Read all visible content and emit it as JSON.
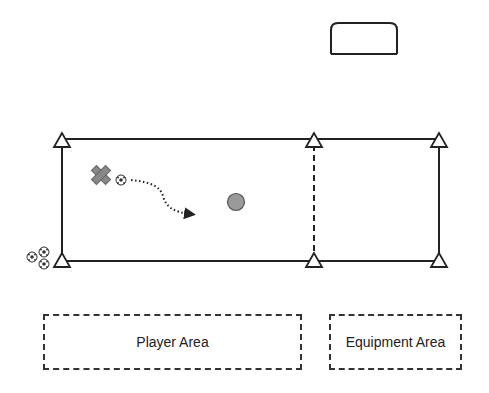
{
  "diagram": {
    "type": "soccer drill layout",
    "goal": {
      "label": "goal",
      "shape": "rounded-rectangle"
    },
    "field": {
      "main_grid": {
        "border": "solid"
      },
      "divider": {
        "style": "dashed"
      },
      "cones": 6
    },
    "player": {
      "symbol": "cross",
      "color": "#888888"
    },
    "ball_path": {
      "style": "dotted-arrow"
    },
    "target_marker": {
      "symbol": "circle",
      "color": "#999999"
    },
    "ball_supply": {
      "count": 3
    },
    "areas": {
      "player_area": "Player Area",
      "equipment_area": "Equipment Area"
    }
  }
}
